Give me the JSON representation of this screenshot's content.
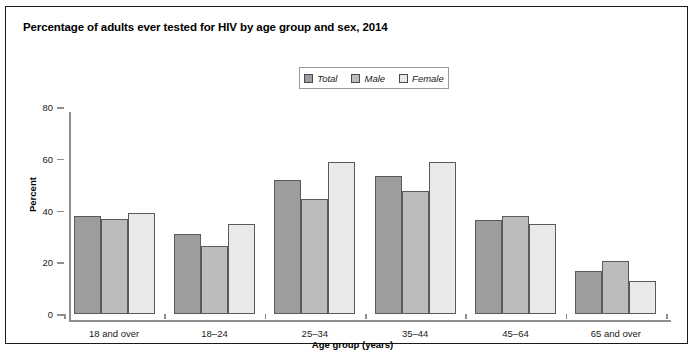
{
  "title": "Percentage of adults ever tested for HIV by age group and sex, 2014",
  "legend": {
    "items": [
      {
        "label": "Total",
        "color": "#9d9d9d"
      },
      {
        "label": "Male",
        "color": "#bcbcbc"
      },
      {
        "label": "Female",
        "color": "#e9e9e9"
      }
    ]
  },
  "axes": {
    "ylabel": "Percent",
    "xlabel": "Age group (years)",
    "yticks": [
      "0",
      "20",
      "40",
      "60",
      "80"
    ]
  },
  "chart_data": {
    "type": "bar",
    "title": "Percentage of adults ever tested for HIV by age group and sex, 2014",
    "xlabel": "Age group (years)",
    "ylabel": "Percent",
    "ylim": [
      0,
      80
    ],
    "yticks": [
      0,
      20,
      40,
      60,
      80
    ],
    "grid": false,
    "legend_position": "top-center",
    "categories": [
      "18 and over",
      "18–24",
      "25–34",
      "35–44",
      "45–64",
      "65 and over"
    ],
    "series": [
      {
        "name": "Total",
        "color": "#9d9d9d",
        "values": [
          38.0,
          30.8,
          51.8,
          53.2,
          36.4,
          16.6
        ]
      },
      {
        "name": "Male",
        "color": "#bcbcbc",
        "values": [
          36.8,
          26.2,
          44.6,
          47.4,
          37.9,
          20.6
        ]
      },
      {
        "name": "Female",
        "color": "#e9e9e9",
        "values": [
          39.0,
          34.8,
          58.7,
          58.6,
          34.6,
          12.7
        ]
      }
    ]
  }
}
